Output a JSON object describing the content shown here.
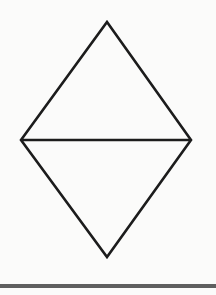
{
  "figure": {
    "background_color": "#fbfbfa",
    "stroke_color": "#1c1c1c",
    "stroke_width": 2.6,
    "vertices": {
      "top": {
        "x": 107,
        "y": 22
      },
      "right": {
        "x": 191,
        "y": 140
      },
      "bottom": {
        "x": 107,
        "y": 257
      },
      "left": {
        "x": 21,
        "y": 140
      }
    },
    "midline": {
      "x1": 21,
      "y1": 140,
      "x2": 191,
      "y2": 140
    }
  },
  "bottom_rule": {
    "color": "#5f5f5f",
    "x": 0,
    "y": 284,
    "width": 216,
    "height": 4
  },
  "canvas": {
    "width": 216,
    "height": 295
  }
}
